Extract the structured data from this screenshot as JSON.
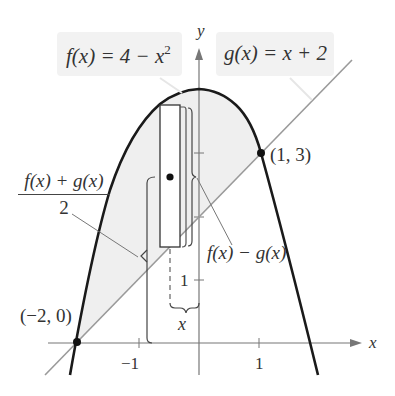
{
  "figure": {
    "f_label": "f(x) = 4 − x²",
    "f_label_parts": {
      "lhs": "f(x) = 4 − x",
      "sup": "2"
    },
    "g_label": "g(x) = x + 2",
    "midpoint_label": {
      "numerator": "f(x) + g(x)",
      "denominator": "2"
    },
    "difference_label": "f(x) − g(x)",
    "width_label": "x",
    "axis_x_label": "x",
    "axis_y_label": "y",
    "point_left": "(−2, 0)",
    "point_right": "(1, 3)",
    "tick_x_neg1": "−1",
    "tick_x_1": "1",
    "tick_y_1": "1",
    "colors": {
      "curve": "#1a1a1a",
      "line": "#9a9a9a",
      "region": "#efefef",
      "axis": "#777777"
    }
  }
}
